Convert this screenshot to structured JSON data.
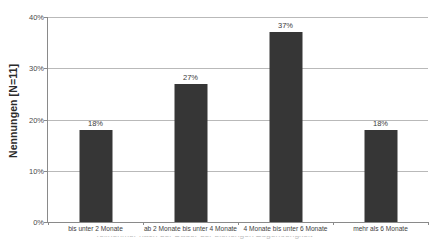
{
  "chart_data": {
    "type": "bar",
    "title": "",
    "xlabel": "",
    "ylabel": "Nennungen [N=11]",
    "ylim": [
      0,
      40
    ],
    "grid": true,
    "legend": "none",
    "units": "percent",
    "categories": [
      "bis unter 2 Monate",
      "ab 2 Monate bis unter 4 Monate",
      "4 Monate bis unter 6 Monate",
      "mehr als 6 Monate"
    ],
    "values": [
      18,
      27,
      37,
      18
    ],
    "value_labels": [
      "18%",
      "27%",
      "37%",
      "18%"
    ],
    "y_ticks": [
      0,
      10,
      20,
      30,
      40
    ],
    "y_tick_labels": [
      "0%",
      "10%",
      "20%",
      "30%",
      "40%"
    ],
    "bar_color": "#363636",
    "gridline_color": "#b9b9b9",
    "axis_color": "#8a8a8a"
  },
  "caption_fragment": "Teilnehmer nach der Dauer der bisherigen Zugehoerigkeit"
}
